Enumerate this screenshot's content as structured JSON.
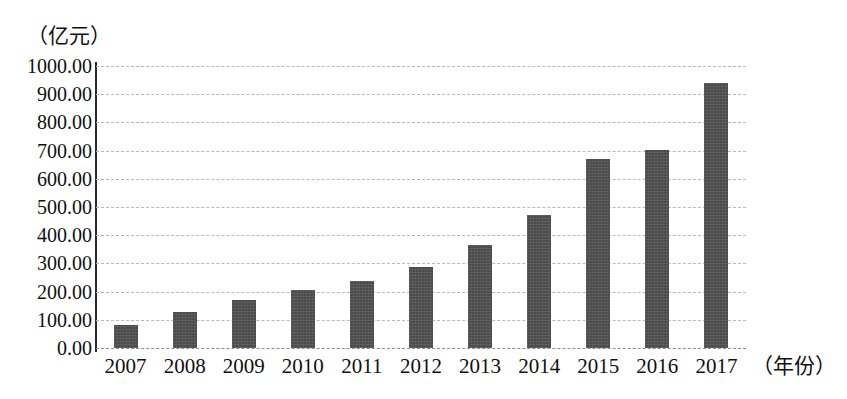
{
  "chart_data": {
    "type": "bar",
    "title": "",
    "subtitle": "",
    "xlabel": "（年份）",
    "ylabel": "（亿元）",
    "categories": [
      "2007",
      "2008",
      "2009",
      "2010",
      "2011",
      "2012",
      "2013",
      "2014",
      "2015",
      "2016",
      "2017"
    ],
    "values": [
      80,
      127,
      172,
      207,
      236,
      288,
      367,
      472,
      672,
      702,
      940
    ],
    "ylim": [
      0,
      1000
    ],
    "ytick_values": [
      1000,
      900,
      800,
      700,
      600,
      500,
      400,
      300,
      200,
      100,
      0
    ],
    "ytick_labels": [
      "1000.00",
      "900.00",
      "800.00",
      "700.00",
      "600.00",
      "500.00",
      "400.00",
      "300.00",
      "200.00",
      "100.00",
      "0.00"
    ],
    "grid": true,
    "grid_style": "dashed-horizontal",
    "legend": null,
    "legend_position": "none",
    "bar_color": "#4b4b4b",
    "grid_color": "#b9b9b9",
    "axis_color": "#2a2a2a",
    "background_color": "#ffffff"
  }
}
